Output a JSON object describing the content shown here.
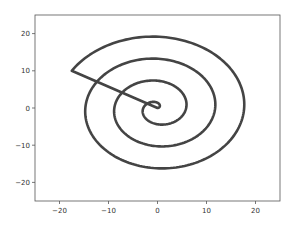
{
  "chart_data": {
    "type": "line",
    "title": "",
    "xlabel": "",
    "ylabel": "",
    "xlim": [
      -25,
      25
    ],
    "ylim": [
      -25,
      25
    ],
    "grid": false,
    "legend": null,
    "xticks": [
      -20,
      -10,
      0,
      10,
      20
    ],
    "yticks": [
      -20,
      -10,
      0,
      10,
      20
    ],
    "xtick_labels": [
      "−20",
      "−10",
      "0",
      "10",
      "20"
    ],
    "ytick_labels": [
      "20",
      "10",
      "0",
      "−10",
      "−20"
    ],
    "series": [
      {
        "name": "spiral",
        "description": "Archimedean spiral r ≈ θ starting at origin, winding counterclockwise outward ~3.4 turns to endpoint (−17.5, 10), then a straight segment back to origin (0, 0)",
        "color": "#444444",
        "linewidth": 2.5,
        "theta_max_rad": 21.4,
        "endpoint": [
          -17.5,
          10
        ],
        "closing_segment": [
          [
            -17.5,
            10
          ],
          [
            0,
            0
          ]
        ],
        "key_points": [
          {
            "x": 0,
            "y": 0
          },
          {
            "x": 4.5,
            "y": 0
          },
          {
            "x": 0,
            "y": 6.5
          },
          {
            "x": -8,
            "y": 0
          },
          {
            "x": 0,
            "y": -9.5
          },
          {
            "x": 10.5,
            "y": 0
          },
          {
            "x": 0,
            "y": 12.5
          },
          {
            "x": -14,
            "y": 0
          },
          {
            "x": 0,
            "y": -15.5
          },
          {
            "x": 17,
            "y": 0
          },
          {
            "x": 0,
            "y": 19
          },
          {
            "x": -17.5,
            "y": 10
          }
        ]
      }
    ]
  },
  "colors": {
    "line": "#444444",
    "axes": "#555555",
    "background": "#ffffff"
  }
}
